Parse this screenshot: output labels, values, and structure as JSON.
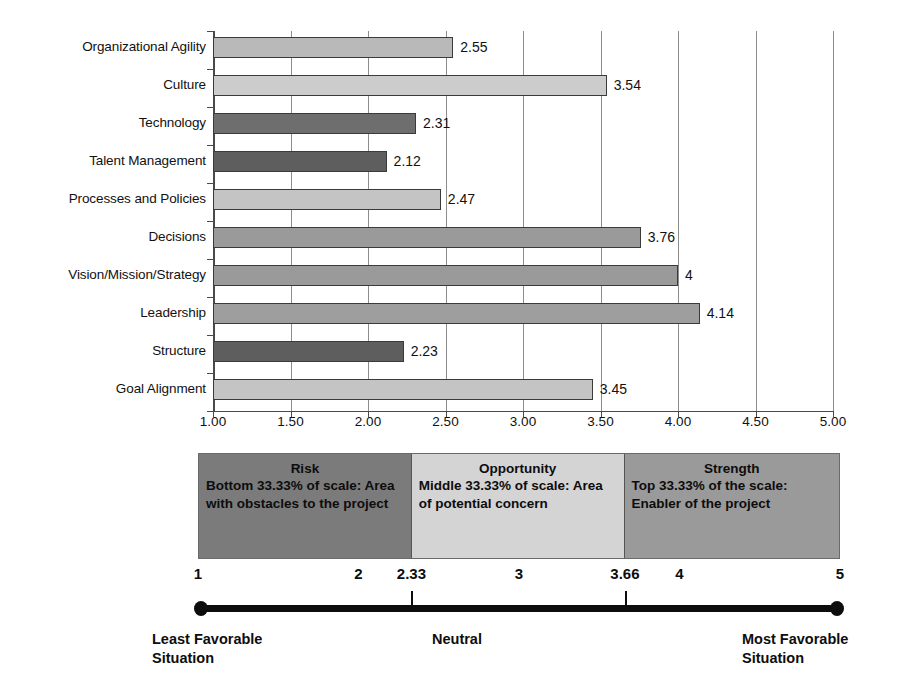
{
  "chart_data": {
    "type": "bar",
    "orientation": "horizontal",
    "title": "",
    "xlabel": "",
    "ylabel": "",
    "xlim": [
      1.0,
      5.0
    ],
    "grid": true,
    "legend_position": "below",
    "categories": [
      "Organizational Agility",
      "Culture",
      "Technology",
      "Talent Management",
      "Processes and Policies",
      "Decisions",
      "Vision/Mission/Strategy",
      "Leadership",
      "Structure",
      "Goal Alignment"
    ],
    "values": [
      2.55,
      3.54,
      2.31,
      2.12,
      2.47,
      3.76,
      4,
      4.14,
      2.23,
      3.45
    ],
    "value_labels": [
      "2.55",
      "3.54",
      "2.31",
      "2.12",
      "2.47",
      "3.76",
      "4",
      "4.14",
      "2.23",
      "3.45"
    ],
    "bar_colors": [
      "#b9b9b9",
      "#cccccc",
      "#6e6e6e",
      "#5e5e5e",
      "#c4c4c4",
      "#9a9a9a",
      "#9a9a9a",
      "#9e9e9e",
      "#5e5e5e",
      "#c4c4c4"
    ],
    "xticks": [
      1.0,
      1.5,
      2.0,
      2.5,
      3.0,
      3.5,
      4.0,
      4.5,
      5.0
    ],
    "xtick_labels": [
      "1.00",
      "1.50",
      "2.00",
      "2.50",
      "3.00",
      "3.50",
      "4.00",
      "4.50",
      "5.00"
    ]
  },
  "legend": {
    "panels": [
      {
        "title": "Risk",
        "body": "Bottom 33.33% of scale: Area with obstacles to the project",
        "color": "#7b7b7b",
        "range": [
          1,
          2.33
        ]
      },
      {
        "title": "Opportunity",
        "body": "Middle 33.33% of scale: Area of potential concern",
        "color": "#d4d4d4",
        "range": [
          2.33,
          3.66
        ]
      },
      {
        "title": "Strength",
        "body": "Top 33.33% of the scale: Enabler of the project",
        "color": "#9a9a9a",
        "range": [
          3.66,
          5
        ]
      }
    ]
  },
  "scale": {
    "numbers": [
      "1",
      "2",
      "2.33",
      "3",
      "3.66",
      "4",
      "5"
    ],
    "number_values": [
      1,
      2,
      2.33,
      3,
      3.66,
      4,
      5
    ],
    "ticks": [
      2.33,
      3.66
    ],
    "captions": {
      "left": "Least Favorable\nSituation",
      "center": "Neutral",
      "right": "Most Favorable\nSituation"
    }
  }
}
